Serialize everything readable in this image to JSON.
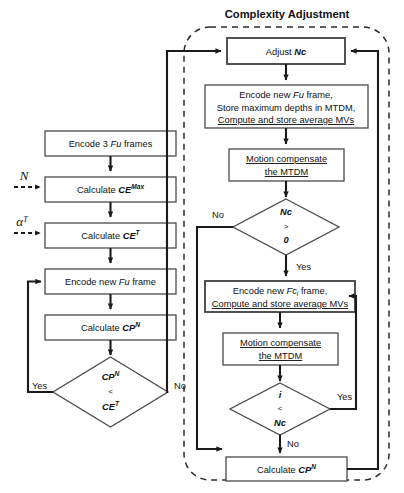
{
  "diagram": {
    "title": "Complexity Adjustment",
    "region_label": "Complexity Adjustment",
    "left_column": {
      "box_encode3": "Encode 3 Fu frames",
      "box_encode3_plain": "Encode 3 ",
      "box_encode3_it": "Fu",
      "box_encode3_tail": " frames",
      "box_cemax_plain": "Calculate ",
      "box_cemax_sym": "CE",
      "box_cemax_sup": "Max",
      "box_cet_plain": "Calculate ",
      "box_cet_sym": "CE",
      "box_cet_sup": "T",
      "box_encode_new_plain": "Encode new ",
      "box_encode_new_it": "Fu",
      "box_encode_new_tail": " frame",
      "box_cpn_plain": "Calculate ",
      "box_cpn_sym": "CP",
      "box_cpn_sup": "N",
      "input_n": "N",
      "input_alpha": "α",
      "input_alpha_sup": "T",
      "decision_line1_sym": "CP",
      "decision_line1_sup": "N",
      "decision_line2": "<",
      "decision_line3_sym": "CE",
      "decision_line3_sup": "T",
      "branch_yes": "Yes",
      "branch_no": "No"
    },
    "right_column": {
      "box_adjust_plain": "Adjust ",
      "box_adjust_sym": "Nc",
      "box_encode_fu_l1a": "Encode new ",
      "box_encode_fu_l1b": "Fu",
      "box_encode_fu_l1c": " frame,",
      "box_encode_fu_l2": "Store maximum depths in MTDM,",
      "box_encode_fu_l3": "Compute and store average MVs",
      "box_motion1_l1": "Motion compensate",
      "box_motion1_l2": "the MTDM",
      "decision_nc_l1": "Nc",
      "decision_nc_l2": ">",
      "decision_nc_l3": "0",
      "decision_nc_yes": "Yes",
      "decision_nc_no": "No",
      "box_encode_fc_l1a": "Encode new ",
      "box_encode_fc_l1b": "Fc",
      "box_encode_fc_l1sub": "i",
      "box_encode_fc_l1c": " frame,",
      "box_encode_fc_l2": "Compute and store average MVs",
      "box_motion2_l1": "Motion compensate",
      "box_motion2_l2": "the MTDM",
      "decision_i_l1": "i",
      "decision_i_l2": "<",
      "decision_i_l3": "Nc",
      "decision_i_yes": "Yes",
      "decision_i_no": "No",
      "box_calc_cpn_plain": "Calculate ",
      "box_calc_cpn_sym": "CP",
      "box_calc_cpn_sup": "N"
    },
    "colors": {
      "box_stroke": "#4a4a4a",
      "line": "#1a1a1a",
      "region_stroke": "#2b2b2b",
      "background": "#ffffff",
      "text": "#111111"
    }
  }
}
